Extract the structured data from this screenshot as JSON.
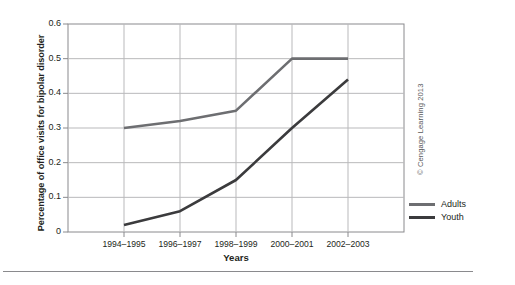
{
  "chart_data": {
    "type": "line",
    "title": "",
    "xlabel": "Years",
    "ylabel": "Percentage of office visits for bipolar disorder",
    "categories": [
      "1994–1995",
      "1996–1997",
      "1998–1999",
      "2000–2001",
      "2002–2003"
    ],
    "series": [
      {
        "name": "Adults",
        "values": [
          0.3,
          0.32,
          0.35,
          0.5,
          0.5
        ],
        "color": "#6d6e71"
      },
      {
        "name": "Youth",
        "values": [
          0.02,
          0.06,
          0.15,
          0.3,
          0.44
        ],
        "color": "#3b3b3d"
      }
    ],
    "yticks": [
      "0",
      "0.1",
      "0.2",
      "0.3",
      "0.4",
      "0.5",
      "0.6"
    ],
    "ylim": [
      0,
      0.6
    ],
    "grid": true,
    "legend_position": "right"
  },
  "legend": {
    "items": [
      {
        "label": "Adults"
      },
      {
        "label": "Youth"
      }
    ]
  },
  "credit": {
    "text": "© Cengage Learning 2013"
  },
  "colors": {
    "adults": "#6d6e71",
    "youth": "#3b3b3d",
    "grid": "#b9b9bb",
    "axis": "#8a8a8d",
    "text": "#231f20"
  }
}
